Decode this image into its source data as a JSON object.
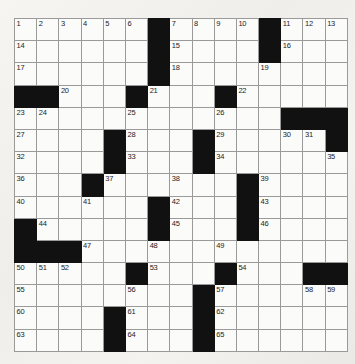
{
  "puzzle": {
    "title": "Crossword Grid",
    "rows": 15,
    "cols": 15,
    "cell_size_px": 21.2,
    "colors": {
      "block": "#111111",
      "cell": "#fbfbfa",
      "grid_line": "#9a9a9a",
      "page_background": "#f2f1ee",
      "number_text": "#23231f"
    },
    "grid": [
      [
        {
          "n": "1"
        },
        {
          "n": "2"
        },
        {
          "n": "3"
        },
        {
          "n": "4"
        },
        {
          "n": "5"
        },
        {
          "n": "6"
        },
        {
          "b": true
        },
        {
          "n": "7"
        },
        {
          "n": "8"
        },
        {
          "n": "9"
        },
        {
          "n": "10"
        },
        {
          "b": true
        },
        {
          "n": "11"
        },
        {
          "n": "12"
        },
        {
          "n": "13"
        }
      ],
      [
        {
          "n": "14"
        },
        {},
        {},
        {},
        {},
        {},
        {
          "b": true
        },
        {
          "n": "15"
        },
        {},
        {},
        {},
        {
          "b": true
        },
        {
          "n": "16"
        },
        {},
        {}
      ],
      [
        {
          "n": "17"
        },
        {},
        {},
        {},
        {},
        {},
        {
          "b": true
        },
        {
          "n": "18"
        },
        {},
        {},
        {},
        {
          "n": "19"
        },
        {},
        {},
        {}
      ],
      [
        {
          "b": true
        },
        {
          "b": true
        },
        {
          "n": "20"
        },
        {},
        {},
        {
          "b": true
        },
        {
          "n": "21"
        },
        {},
        {},
        {
          "b": true
        },
        {
          "n": "22"
        },
        {},
        {},
        {},
        {}
      ],
      [
        {
          "n": "23"
        },
        {
          "n": "24"
        },
        {},
        {},
        {},
        {
          "n": "25"
        },
        {},
        {},
        {},
        {
          "n": "26"
        },
        {},
        {},
        {
          "b": true
        },
        {
          "b": true
        },
        {
          "b": true
        }
      ],
      [
        {
          "n": "27"
        },
        {},
        {},
        {},
        {
          "b": true
        },
        {
          "n": "28"
        },
        {},
        {},
        {
          "b": true
        },
        {
          "n": "29"
        },
        {},
        {},
        {
          "n": "30"
        },
        {
          "n": "31"
        },
        {
          "b": true
        }
      ],
      [
        {
          "n": "32"
        },
        {},
        {},
        {},
        {
          "b": true
        },
        {
          "n": "33"
        },
        {},
        {},
        {
          "b": true
        },
        {
          "n": "34"
        },
        {},
        {},
        {},
        {},
        {
          "n": "35"
        }
      ],
      [
        {
          "n": "36"
        },
        {},
        {},
        {
          "b": true
        },
        {
          "n": "37"
        },
        {},
        {},
        {
          "n": "38"
        },
        {},
        {},
        {
          "b": true
        },
        {
          "n": "39"
        },
        {},
        {},
        {}
      ],
      [
        {
          "n": "40"
        },
        {},
        {},
        {
          "n": "41"
        },
        {},
        {},
        {
          "b": true
        },
        {
          "n": "42"
        },
        {},
        {},
        {
          "b": true
        },
        {
          "n": "43"
        },
        {},
        {},
        {}
      ],
      [
        {
          "b": true
        },
        {
          "n": "44"
        },
        {},
        {},
        {},
        {},
        {
          "b": true
        },
        {
          "n": "45"
        },
        {},
        {},
        {
          "b": true
        },
        {
          "n": "46"
        },
        {},
        {},
        {}
      ],
      [
        {
          "b": true
        },
        {
          "b": true
        },
        {
          "b": true
        },
        {
          "n": "47"
        },
        {},
        {},
        {
          "n": "48"
        },
        {},
        {},
        {
          "n": "49"
        },
        {},
        {},
        {},
        {},
        {}
      ],
      [
        {
          "n": "50"
        },
        {
          "n": "51"
        },
        {
          "n": "52"
        },
        {},
        {},
        {
          "b": true
        },
        {
          "n": "53"
        },
        {},
        {},
        {
          "b": true
        },
        {
          "n": "54"
        },
        {},
        {},
        {
          "b": true
        },
        {
          "b": true
        }
      ],
      [
        {
          "n": "55"
        },
        {},
        {},
        {},
        {},
        {
          "n": "56"
        },
        {},
        {},
        {
          "b": true
        },
        {
          "n": "57"
        },
        {},
        {},
        {},
        {
          "n": "58"
        },
        {
          "n": "59"
        }
      ],
      [
        {
          "n": "60"
        },
        {},
        {},
        {},
        {
          "b": true
        },
        {
          "n": "61"
        },
        {},
        {},
        {
          "b": true
        },
        {
          "n": "62"
        },
        {},
        {},
        {},
        {},
        {}
      ],
      [
        {
          "n": "63"
        },
        {},
        {},
        {},
        {
          "b": true
        },
        {
          "n": "64"
        },
        {},
        {},
        {
          "b": true
        },
        {
          "n": "65"
        },
        {},
        {},
        {},
        {},
        {}
      ]
    ]
  }
}
